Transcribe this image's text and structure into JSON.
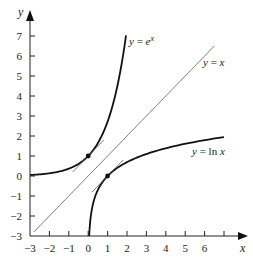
{
  "chart_data": {
    "type": "line",
    "title": "",
    "xlabel": "x",
    "ylabel": "y",
    "xlim": [
      -3,
      7
    ],
    "ylim": [
      -3,
      7.5
    ],
    "grid": false,
    "legend": "none (inline curve labels)",
    "x_ticks": [
      "-3",
      "-2",
      "-1",
      "0",
      "1",
      "2",
      "3",
      "4",
      "5",
      "6"
    ],
    "y_ticks": [
      "-3",
      "-2",
      "-1",
      "0",
      "1",
      "2",
      "3",
      "4",
      "5",
      "6",
      "7"
    ],
    "series": [
      {
        "name": "y = e^x",
        "label": "y = e",
        "label_sup": "x",
        "function": "exp",
        "x_range": [
          -3,
          1.95
        ],
        "style": "thick"
      },
      {
        "name": "y = x",
        "label": "y = x",
        "function": "identity",
        "x_range": [
          -2.8,
          6.5
        ],
        "style": "thin"
      },
      {
        "name": "y = ln x",
        "label": "y = ln x",
        "function": "log",
        "x_range": [
          0.05,
          7
        ],
        "style": "thick"
      }
    ],
    "points": [
      {
        "x": 0,
        "y": 1,
        "on": "y = e^x"
      },
      {
        "x": 1,
        "y": 0,
        "on": "y = ln x"
      }
    ],
    "tangent_segments": [
      {
        "at": [
          0,
          1
        ],
        "slope": 1,
        "x_range": [
          -0.8,
          0.8
        ]
      },
      {
        "at": [
          1,
          0
        ],
        "slope": 1,
        "x_range": [
          0.2,
          1.8
        ]
      }
    ],
    "annotations": [
      "y = e^x",
      "y = x",
      "y = ln x"
    ]
  }
}
